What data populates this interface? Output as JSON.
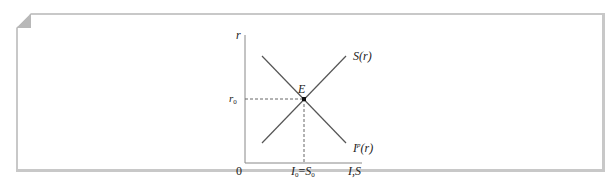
{
  "diagram": {
    "type": "economics-supply-demand",
    "frame": {
      "border_color": "#c8c8c8",
      "corner_fold": "top-left"
    },
    "axes": {
      "y_label": "r",
      "x_label": "I,S",
      "origin_label": "0"
    },
    "curves": [
      {
        "name": "saving",
        "label": "S(r)",
        "label_main": "S",
        "label_arg": "(r)",
        "slope": "upward"
      },
      {
        "name": "investment",
        "label": "I^p(r)",
        "label_main": "I",
        "label_sup": "p",
        "label_arg": "(r)",
        "slope": "downward"
      }
    ],
    "equilibrium": {
      "label": "E",
      "y_tick_label": "r0",
      "y_tick_main": "r",
      "y_tick_sub": "0",
      "x_tick_label": "I0=S0",
      "x_tick_i": "I",
      "x_tick_i_sub": "0",
      "x_tick_eq": "=",
      "x_tick_s": "S",
      "x_tick_s_sub": "0"
    },
    "colors": {
      "line": "#555555",
      "axis": "#777777",
      "dashed": "#666666",
      "text": "#222222",
      "point": "#111111"
    }
  }
}
